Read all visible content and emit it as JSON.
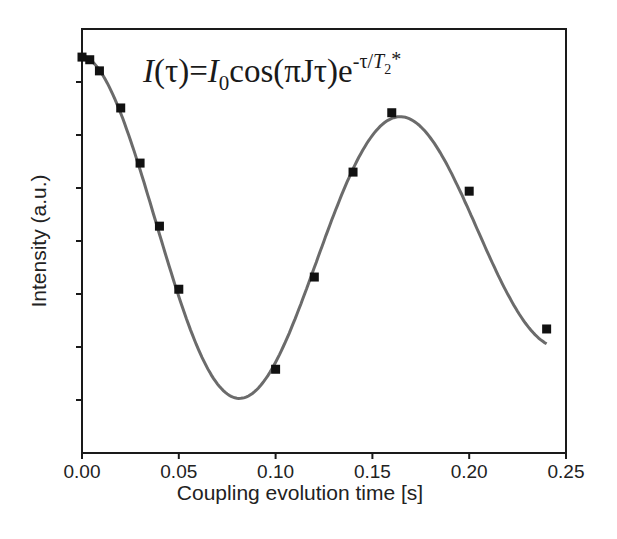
{
  "chart_data": {
    "type": "scatter",
    "title": "",
    "annotation": {
      "formula_parts": {
        "lhs_I": "I",
        "lhs_rest": "(τ)=",
        "rhs_I": "I",
        "rhs_sub0": "0",
        "rhs_body": "cos(πJτ)e",
        "exp_pre": "-τ/",
        "exp_T": "T",
        "exp_sub2": "2",
        "exp_star": "*"
      },
      "text": "I(τ)=I0cos(πJτ)e^(-τ/T2*)"
    },
    "xlabel": "Coupling evolution time [s]",
    "ylabel": "Intensity (a.u.)",
    "xlim": [
      0.0,
      0.25
    ],
    "ylim": [
      0,
      8
    ],
    "xticks": [
      0.0,
      0.05,
      0.1,
      0.15,
      0.2,
      0.25
    ],
    "xtick_labels": [
      "0.00",
      "0.05",
      "0.10",
      "0.15",
      "0.20",
      "0.25"
    ],
    "yticks": [
      1,
      2,
      3,
      4,
      5,
      6,
      7
    ],
    "ytick_labels": [],
    "grid": false,
    "legend": null,
    "series": [
      {
        "name": "measured",
        "kind": "scatter",
        "marker": "square",
        "color": "#111111",
        "x": [
          0.0,
          0.004,
          0.009,
          0.02,
          0.03,
          0.04,
          0.05,
          0.1,
          0.12,
          0.14,
          0.16,
          0.2,
          0.24
        ],
        "y": [
          7.47,
          7.42,
          7.21,
          6.51,
          5.47,
          4.28,
          3.09,
          1.58,
          3.32,
          5.3,
          6.42,
          4.94,
          2.34
        ]
      },
      {
        "name": "fit",
        "kind": "line",
        "color": "#6b6b6b",
        "model": "I0*cos(pi*J*t)*exp(-t/T2) + offset",
        "params": {
          "I0": 3.55,
          "J": 12.05,
          "T2": 0.42,
          "offset": 3.95
        },
        "x_range": [
          0.0,
          0.24
        ]
      }
    ]
  }
}
